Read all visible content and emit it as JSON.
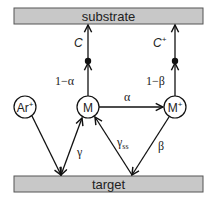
{
  "diagram": {
    "boxes": {
      "substrate": {
        "label": "substrate",
        "fill": "#c8c8c8"
      },
      "target": {
        "label": "target",
        "fill": "#c8c8c8"
      }
    },
    "nodes": {
      "ar": {
        "label": "Ar",
        "sup": "+"
      },
      "m": {
        "label": "M"
      },
      "mplus": {
        "label": "M",
        "sup": "+"
      }
    },
    "edges": {
      "c_label": "C",
      "cplus_label": "C",
      "cplus_sup": "+",
      "one_minus_alpha": "1−α",
      "one_minus_beta": "1−β",
      "alpha": "α",
      "gamma": "γ",
      "gamma_ss": "γ",
      "gamma_ss_sub": "ss",
      "beta": "β"
    }
  }
}
